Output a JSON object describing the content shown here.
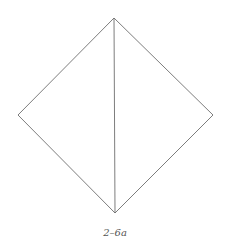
{
  "figure": {
    "caption": "2–6a",
    "stroke_color": "#6e6e6e",
    "background": "#ffffff",
    "vertices": {
      "top": [
        114,
        18
      ],
      "left": [
        18,
        115
      ],
      "right": [
        213,
        115
      ],
      "bottom": [
        115,
        213
      ]
    },
    "edges": [
      {
        "name": "top-left",
        "from": "top",
        "to": "left"
      },
      {
        "name": "left-bottom",
        "from": "left",
        "to": "bottom"
      },
      {
        "name": "bottom-right",
        "from": "bottom",
        "to": "right"
      },
      {
        "name": "right-top",
        "from": "right",
        "to": "top"
      },
      {
        "name": "diagonal",
        "from": "top",
        "to": "bottom"
      }
    ]
  }
}
